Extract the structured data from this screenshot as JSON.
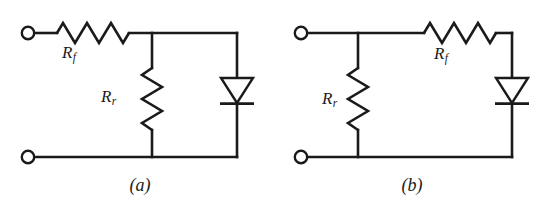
{
  "figure": {
    "background_color": "#ffffff",
    "ink_color": "#1a1a1a",
    "width": 553,
    "height": 211
  },
  "circuits": [
    {
      "id": "a",
      "caption": "(a)",
      "components": {
        "series_resistor": {
          "label_main": "R",
          "label_sub": "f",
          "orientation": "horizontal",
          "position": "top-left-branch"
        },
        "shunt_resistor": {
          "label_main": "R",
          "label_sub": "r",
          "orientation": "vertical",
          "position": "middle-shunt"
        },
        "diode": {
          "name": "diode-symbol",
          "orientation": "vertical",
          "pointing": "down",
          "position": "right-branch"
        },
        "terminals": [
          {
            "name": "terminal-top",
            "position": "top-left"
          },
          {
            "name": "terminal-bottom",
            "position": "bottom-left"
          }
        ]
      }
    },
    {
      "id": "b",
      "caption": "(b)",
      "components": {
        "series_resistor": {
          "label_main": "R",
          "label_sub": "f",
          "orientation": "horizontal",
          "position": "top-right-branch"
        },
        "shunt_resistor": {
          "label_main": "R",
          "label_sub": "r",
          "orientation": "vertical",
          "position": "left-shunt"
        },
        "diode": {
          "name": "diode-symbol",
          "orientation": "vertical",
          "pointing": "down",
          "position": "right-branch"
        },
        "terminals": [
          {
            "name": "terminal-top",
            "position": "top-left"
          },
          {
            "name": "terminal-bottom",
            "position": "bottom-left"
          }
        ]
      }
    }
  ]
}
